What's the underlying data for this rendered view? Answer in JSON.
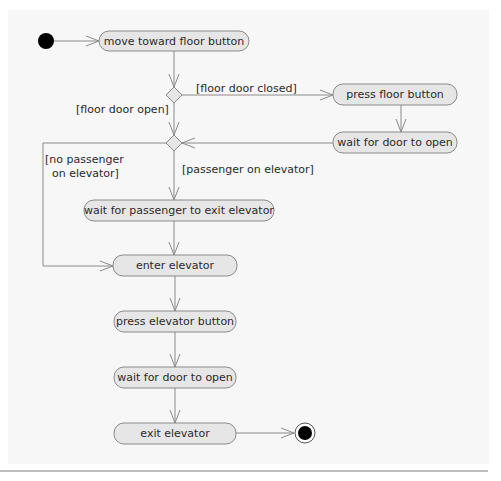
{
  "diagram": {
    "type": "UML activity diagram",
    "colors": {
      "panel": "#f7f7f7",
      "activity_fill": "#e6e6e6",
      "line": "#8a8a8a",
      "text": "#2a2a2a",
      "node": "#000000"
    },
    "activities": {
      "move_toward": "move toward floor button",
      "press_floor": "press floor button",
      "wait_door_1": "wait for door to open",
      "wait_passenger": "wait for passenger to exit elevator",
      "enter": "enter elevator",
      "press_elevator": "press elevator button",
      "wait_door_2": "wait for door to open",
      "exit": "exit elevator"
    },
    "guards": {
      "floor_door_closed": "[floor door closed]",
      "floor_door_open": "[floor door open]",
      "no_passenger_line1": "[no passenger",
      "no_passenger_line2": "on elevator]",
      "passenger_on": "[passenger on elevator]"
    }
  }
}
